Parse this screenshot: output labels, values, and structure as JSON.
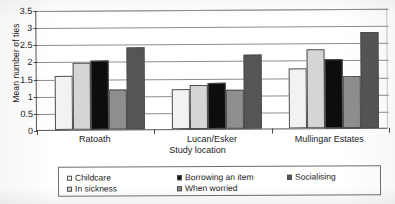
{
  "chart_data": {
    "type": "bar",
    "title": "",
    "xlabel": "Study location",
    "ylabel": "Mean number of ties",
    "categories": [
      "Ratoath",
      "Lucan/Esker",
      "Mullingar Estates"
    ],
    "ylim": [
      0,
      3.5
    ],
    "yticks": [
      "0",
      "0.5",
      "1",
      "1.5",
      "2",
      "2.5",
      "3",
      "3.5"
    ],
    "ytick_values": [
      0,
      0.5,
      1,
      1.5,
      2,
      2.5,
      3,
      3.5
    ],
    "grid": "horizontal",
    "legend_position": "bottom",
    "series": [
      {
        "name": "Childcare",
        "color": "#f2f2f2",
        "values": [
          1.58,
          1.17,
          1.75
        ]
      },
      {
        "name": "In sickness",
        "color": "#d5d5d5",
        "values": [
          1.95,
          1.28,
          2.3
        ]
      },
      {
        "name": "Borrowing an item",
        "color": "#0d0d0d",
        "values": [
          2.0,
          1.35,
          2.0
        ]
      },
      {
        "name": "When worried",
        "color": "#8e8e8e",
        "values": [
          1.17,
          1.14,
          1.53
        ]
      },
      {
        "name": "Socialising",
        "color": "#555555",
        "values": [
          2.4,
          2.15,
          2.8
        ]
      }
    ]
  },
  "legend": {
    "entries": [
      {
        "label": "Childcare",
        "color": "#f2f2f2",
        "col": 0,
        "row": 0
      },
      {
        "label": "In sickness",
        "color": "#d5d5d5",
        "col": 0,
        "row": 1
      },
      {
        "label": "Borrowing an item",
        "color": "#0d0d0d",
        "col": 1,
        "row": 0
      },
      {
        "label": "When worried",
        "color": "#8e8e8e",
        "col": 1,
        "row": 1
      },
      {
        "label": "Socialising",
        "color": "#555555",
        "col": 2,
        "row": 0
      }
    ]
  }
}
